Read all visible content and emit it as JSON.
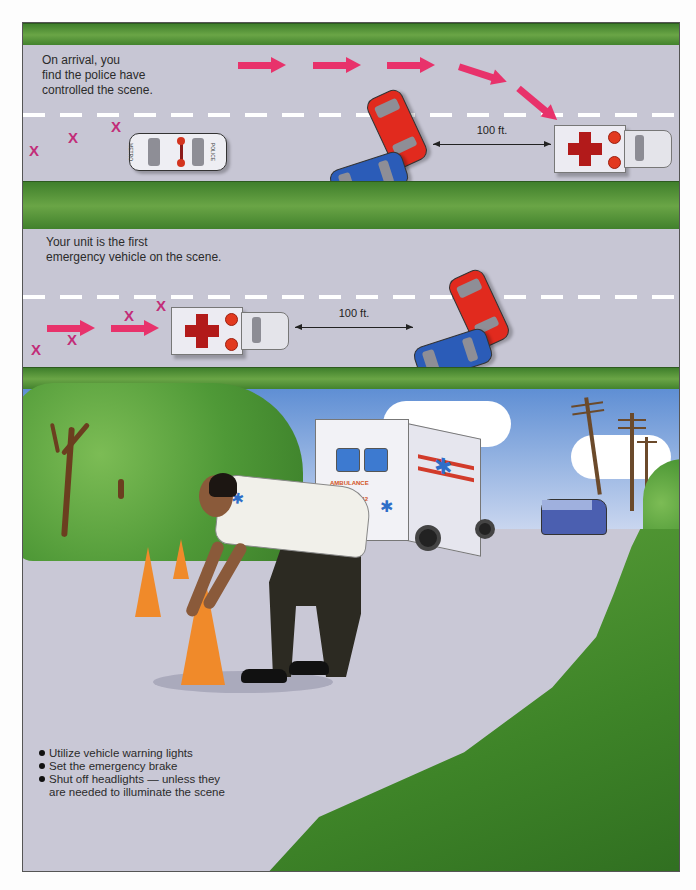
{
  "panels": {
    "top": {
      "caption_line1": "On arrival, you",
      "caption_line2": "find the police have",
      "caption_line3": "controlled the scene.",
      "distance_label": "100 ft.",
      "police_car": {
        "door_text": "POLICE",
        "trunk_text": "METRO"
      }
    },
    "middle": {
      "caption_line1": "Your unit is the first",
      "caption_line2": "emergency vehicle on the scene.",
      "distance_label": "100 ft."
    },
    "scene": {
      "ambulance": {
        "label": "AMBULANCE",
        "number": "No. 42"
      },
      "bullets": [
        "Utilize vehicle warning lights",
        "Set the emergency brake",
        "Shut off headlights — unless they are needed to illuminate the scene"
      ]
    }
  },
  "symbols": {
    "cone_marker": "X"
  },
  "colors": {
    "arrow": "#e8326b",
    "cone_marker": "#c22c78",
    "grass": "#4f8f34",
    "road": "#c7c6d4",
    "cross": "#b21a1a"
  }
}
